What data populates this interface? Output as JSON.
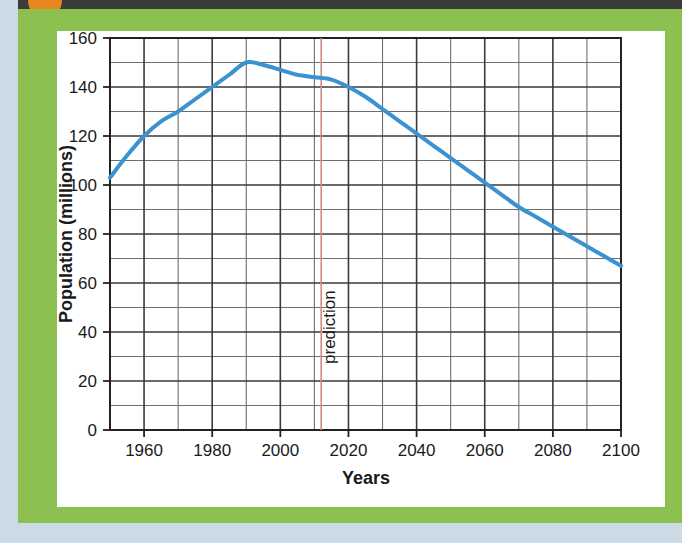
{
  "figure": {
    "frame_color": "#8cc152",
    "card_color": "#ffffff",
    "page_background": "#ccdae5",
    "top_band_color": "#3b3b3b",
    "marker_dot_color": "#e8871e"
  },
  "chart_data": {
    "type": "line",
    "title": "",
    "xlabel": "Years",
    "ylabel": "Population (millions)",
    "xlim": [
      1950,
      2100
    ],
    "ylim": [
      0,
      160
    ],
    "xticks": [
      1960,
      1980,
      2000,
      2020,
      2040,
      2060,
      2080,
      2100
    ],
    "xtick_labels": [
      "1960",
      "1980",
      "2000",
      "2020",
      "2040",
      "2060",
      "2080",
      "2100"
    ],
    "yticks": [
      0,
      20,
      40,
      60,
      80,
      100,
      120,
      140,
      160
    ],
    "ytick_labels": [
      "0",
      "20",
      "40",
      "60",
      "80",
      "100",
      "120",
      "140",
      "160"
    ],
    "x_minor_step": 10,
    "y_minor_step": 10,
    "grid": true,
    "legend": "none",
    "line_color": "#3b92d1",
    "line_width": 4,
    "series": [
      {
        "name": "Population",
        "x": [
          1950,
          1955,
          1960,
          1965,
          1970,
          1975,
          1980,
          1985,
          1990,
          1995,
          2000,
          2005,
          2010,
          2015,
          2020,
          2025,
          2030,
          2035,
          2040,
          2045,
          2050,
          2055,
          2060,
          2065,
          2070,
          2075,
          2080,
          2085,
          2090,
          2095,
          2100
        ],
        "y": [
          103,
          112,
          120,
          126,
          130,
          135,
          140,
          145,
          150,
          149,
          147,
          145,
          144,
          143,
          140,
          136,
          131,
          126,
          121,
          116,
          111,
          106,
          101,
          96,
          91,
          87,
          83,
          79,
          75,
          71,
          67
        ]
      }
    ],
    "annotations": [
      {
        "name": "prediction-line",
        "type": "vline",
        "x": 2012,
        "label": "prediction",
        "color": "#d08a86",
        "label_rotation": -90
      }
    ]
  }
}
